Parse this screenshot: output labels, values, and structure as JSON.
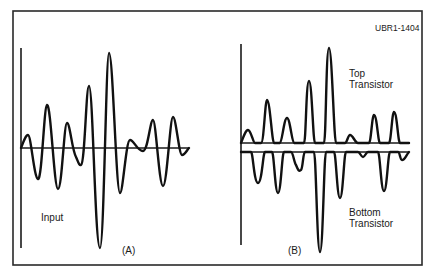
{
  "figure": {
    "id_label": "UBR1-1404",
    "frame": {
      "x": 13,
      "y": 11,
      "width": 409,
      "height": 254
    },
    "colors": {
      "stroke": "#111111",
      "frame": "#2a2a2a",
      "background": "#ffffff"
    }
  },
  "panels": [
    {
      "key": "A",
      "caption": "(A)",
      "caption_pos": [
        122,
        254
      ],
      "vertical_axis": {
        "x": 21,
        "y1": 48,
        "y2": 248
      },
      "baselines": [
        {
          "x1": 21,
          "x2": 189,
          "y": 148
        }
      ],
      "labels": [
        {
          "text": "Input",
          "x": 41,
          "y": 221
        }
      ],
      "wave_path": "M21,148 C24,140 26,135 28,135 C31,135 34,178 38,179 C42,180 44,106 47,105 C51,104 54,189 58,189 C62,189 64,123 67,123 C70,123 72,150 76,157 C78,161 79,166 81,165 C85,163 86,86 89,86 C93,86 95,248 100,248 C104,248 106,53 109,53 C113,53 116,193 120,193 C123,193 126,140 130,140 C134,140 137,151 143,151 C148,151 150,120 153,120 C156,120 159,186 163,186 C167,186 170,117 173,117 C176,117 179,155 182,155 C185,155 187,150 189,148"
    },
    {
      "key": "B",
      "caption": "(B)",
      "caption_pos": [
        288,
        254
      ],
      "vertical_axis": {
        "x": 241,
        "y1": 44,
        "y2": 245
      },
      "baselines": [
        {
          "x1": 241,
          "x2": 409,
          "y": 143
        },
        {
          "x1": 241,
          "x2": 409,
          "y": 152
        }
      ],
      "labels": [
        {
          "text": "Top",
          "x": 349,
          "y": 77
        },
        {
          "text": "Transistor",
          "x": 349,
          "y": 88
        },
        {
          "text": "Bottom",
          "x": 349,
          "y": 216
        },
        {
          "text": "Transistor",
          "x": 349,
          "y": 227
        }
      ],
      "top_wave_path": "M241,143 C244,135 246,130 248,130 C251,130 253,143 255,143 L261,143 C264,143 265,100 267,100 C270,100 272,143 274,143 L280,143 C282,143 284,118 287,118 C290,118 292,143 294,143 L304,143 C306,143 306,81 309,81 C312,81 313,143 315,143 L324,143 C326,143 326,48 329,48 C332,48 334,143 336,143 L345,143 C347,143 348,135 350,135 C353,135 355,143 358,143 L369,143 C371,143 372,115 374,115 C377,115 378,143 380,143 L389,143 C391,143 392,112 394,112 C397,112 398,143 400,143 L409,143",
      "bottom_wave_path": "M241,152 L251,152 C253,152 254,183 258,183 C262,183 263,152 265,152 L272,152 C274,152 275,193 278,193 C281,193 282,152 284,152 L291,152 C293,152 294,162 296,165 C298,170 299,172 301,170 C303,168 303,152 305,152 L314,152 C316,152 317,252 320,252 C323,252 324,152 326,152 L334,152 C336,152 337,198 340,198 C343,198 344,152 346,152 L358,152 C360,152 361,157 363,157 C365,157 366,152 368,152 L378,152 C380,152 381,191 384,191 C387,191 388,152 390,152 L398,152 C400,152 400,160 402,160 C405,160 406,155 409,152"
    }
  ]
}
